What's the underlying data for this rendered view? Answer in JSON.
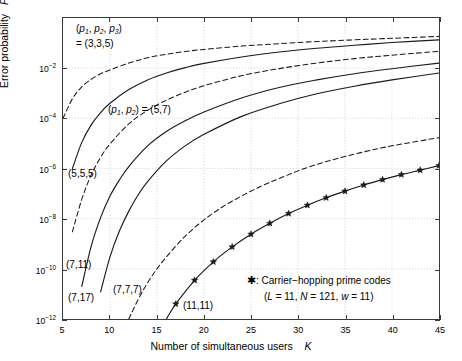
{
  "chart_data": {
    "type": "line",
    "title": "",
    "xlabel": "Number of simultaneous users   K",
    "ylabel": "Error probability   P e,soft",
    "xlim": [
      5,
      45
    ],
    "ylim": [
      1e-12,
      1
    ],
    "yscale": "log",
    "xticks": [
      5,
      10,
      15,
      20,
      25,
      30,
      35,
      40,
      45
    ],
    "xticklabels": [
      "5",
      "10",
      "15",
      "20",
      "25",
      "30",
      "35",
      "40",
      "45"
    ],
    "yticks": [
      0.01,
      0.0001,
      1e-06,
      1e-08,
      1e-10,
      1e-12
    ],
    "yticklabels": [
      "10-2",
      "10-4",
      "10-6",
      "10-8",
      "10-10",
      "10-12"
    ],
    "grid": true,
    "legend_position": "lower right",
    "series": [
      {
        "name": "(3,3,5)",
        "style": "dashed",
        "marker": "none",
        "x": [
          5,
          6,
          7,
          8,
          9,
          10,
          12,
          14,
          16,
          18,
          20,
          24,
          28,
          32,
          36,
          40,
          45
        ],
        "y": [
          0.0001,
          0.0006,
          0.0018,
          0.0036,
          0.006,
          0.0085,
          0.016,
          0.026,
          0.036,
          0.046,
          0.056,
          0.076,
          0.095,
          0.115,
          0.135,
          0.155,
          0.185
        ]
      },
      {
        "name": "(5,7)",
        "style": "solid",
        "marker": "none",
        "x": [
          6,
          7,
          8,
          9,
          10,
          12,
          14,
          16,
          18,
          20,
          24,
          28,
          32,
          36,
          40,
          45
        ],
        "y": [
          1e-06,
          1.1e-05,
          5.5e-05,
          0.00017,
          0.0004,
          0.0014,
          0.0034,
          0.0064,
          0.0105,
          0.0155,
          0.028,
          0.044,
          0.062,
          0.082,
          0.105,
          0.135
        ]
      },
      {
        "name": "(5,5,5)",
        "style": "dashed",
        "marker": "none",
        "x": [
          6,
          7,
          8,
          9,
          10,
          12,
          14,
          16,
          18,
          20,
          24,
          28,
          32,
          36,
          40,
          45
        ],
        "y": [
          3e-09,
          6e-08,
          5.5e-07,
          2.8e-06,
          9.5e-06,
          6e-05,
          0.00021,
          0.00053,
          0.0011,
          0.002,
          0.005,
          0.0096,
          0.016,
          0.024,
          0.033,
          0.047
        ]
      },
      {
        "name": "(7,11)",
        "style": "solid",
        "marker": "none",
        "x": [
          7,
          8,
          9,
          10,
          11,
          12,
          14,
          16,
          18,
          20,
          24,
          28,
          32,
          36,
          40,
          45
        ],
        "y": [
          2e-11,
          8e-10,
          1.1e-08,
          8e-08,
          3.5e-07,
          1.2e-06,
          8e-06,
          3e-05,
          8e-05,
          0.00018,
          0.00065,
          0.0017,
          0.0034,
          0.006,
          0.0095,
          0.016
        ]
      },
      {
        "name": "(7,17)",
        "style": "solid",
        "marker": "none",
        "x": [
          9,
          10,
          11,
          12,
          13,
          14,
          16,
          18,
          20,
          24,
          28,
          32,
          36,
          40,
          45
        ],
        "y": [
          1.2e-11,
          3e-10,
          3.2e-09,
          2e-08,
          9e-08,
          3e-07,
          2e-06,
          8e-06,
          2.3e-05,
          0.00012,
          0.00038,
          0.00095,
          0.0019,
          0.0034,
          0.0064
        ]
      },
      {
        "name": "(7,7,7)",
        "style": "dashed",
        "marker": "none",
        "x": [
          12,
          13,
          14,
          15,
          16,
          18,
          20,
          22,
          24,
          26,
          28,
          31,
          34,
          37,
          40,
          45
        ],
        "y": [
          1e-12,
          6e-12,
          2.8e-11,
          1e-10,
          3e-10,
          2e-09,
          9e-09,
          3e-08,
          8e-08,
          1.9e-07,
          4e-07,
          1.1e-06,
          2.4e-06,
          4.6e-06,
          8e-06,
          1.7e-05
        ]
      },
      {
        "name": "(11,11)",
        "style": "solid",
        "marker": "star",
        "x": [
          16,
          17,
          19,
          21,
          23,
          25,
          27,
          29,
          31,
          33,
          35,
          37,
          39,
          41,
          43,
          45
        ],
        "y": [
          1e-12,
          4e-12,
          3.5e-11,
          1.9e-10,
          7.5e-10,
          2.4e-09,
          6.5e-09,
          1.6e-08,
          3.4e-08,
          6.8e-08,
          1.25e-07,
          2.2e-07,
          3.6e-07,
          5.7e-07,
          8.6e-07,
          1.3e-06
        ]
      }
    ],
    "annotations": [
      {
        "name": "p1p2p3-label",
        "text_line1": "(p1, p2, p3)",
        "text_line2": "= (3,3,5)"
      },
      {
        "name": "p1p2-label",
        "text": "(p1, p2) = (5,7)"
      },
      {
        "name": "label-555",
        "text": "(5,5,5)"
      },
      {
        "name": "label-711",
        "text": "(7,11)"
      },
      {
        "name": "label-717",
        "text": "(7,17)"
      },
      {
        "name": "label-777",
        "text": "(7,7,7)"
      },
      {
        "name": "label-1111",
        "text": "(11,11)"
      }
    ]
  },
  "axes": {
    "yticklabels": [
      {
        "mant": "10",
        "exp": "-2"
      },
      {
        "mant": "10",
        "exp": "-4"
      },
      {
        "mant": "10",
        "exp": "-6"
      },
      {
        "mant": "10",
        "exp": "-8"
      },
      {
        "mant": "10",
        "exp": "-10"
      },
      {
        "mant": "10",
        "exp": "-12"
      }
    ],
    "xticklabels": [
      "5",
      "10",
      "15",
      "20",
      "25",
      "30",
      "35",
      "40",
      "45"
    ],
    "ylabel_text": "Error probability",
    "ylabel_symbol": "P",
    "ylabel_subscript": "e,soft",
    "xlabel_text": "Number of simultaneous users",
    "xlabel_symbol": "K"
  },
  "annotations": {
    "a1_line1_pre": "(",
    "a1_line1": "p",
    "a1_sub1": "1",
    "a1_mid1": ", ",
    "a1_p2": "p",
    "a1_sub2": "2",
    "a1_mid2": ", ",
    "a1_p3": "p",
    "a1_sub3": "3",
    "a1_close": ")",
    "a1_line2": "= (3,3,5)",
    "a2_open": "(",
    "a2_p1": "p",
    "a2_s1": "1",
    "a2_comma": ", ",
    "a2_p2": "p",
    "a2_s2": "2",
    "a2_tail": ") = (5,7)",
    "label_555": "(5,5,5)",
    "label_711": "(7,11)",
    "label_717": "(7,17)",
    "label_777": "(7,7,7)",
    "label_1111": "(11,11)"
  },
  "legend": {
    "marker_glyph": "✱",
    "line1_sep": ": ",
    "line1": "Carrier−hopping prime codes",
    "line2_open": "(",
    "line2_L": "L",
    "line2_Lval": " = 11, ",
    "line2_N": "N",
    "line2_Nval": " = 121, ",
    "line2_w": "w",
    "line2_wval": " = 11)"
  },
  "colors": {
    "axis": "#3a3a3a",
    "grid": "#c8c8c8",
    "curve": "#1a1a1a",
    "background": "#ffffff"
  }
}
